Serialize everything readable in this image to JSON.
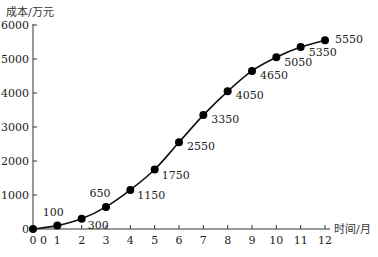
{
  "chart_data": {
    "type": "line",
    "title": "",
    "xlabel": "时间/月",
    "ylabel": "成本/万元",
    "x": [
      0,
      1,
      2,
      3,
      4,
      5,
      6,
      7,
      8,
      9,
      10,
      11,
      12
    ],
    "series": [
      {
        "name": "成本",
        "values": [
          0,
          100,
          300,
          650,
          1150,
          1750,
          2550,
          3350,
          4050,
          4650,
          5050,
          5350,
          5550
        ]
      }
    ],
    "data_labels": [
      "0",
      "100",
      "300",
      "650",
      "1150",
      "1750",
      "2550",
      "3350",
      "4050",
      "4650",
      "5050",
      "5350",
      "5550"
    ],
    "xticks": [
      "0",
      "1",
      "2",
      "3",
      "4",
      "5",
      "6",
      "7",
      "8",
      "9",
      "10",
      "11",
      "12"
    ],
    "yticks": [
      "0",
      "1000",
      "2000",
      "3000",
      "4000",
      "5000",
      "6000"
    ],
    "xlim": [
      0,
      12
    ],
    "ylim": [
      0,
      6000
    ],
    "grid": false,
    "legend": "none",
    "marker": "filled-circle",
    "line_color": "#111111"
  },
  "axes": {
    "y_title": "成本/万元",
    "x_title": "时间/月",
    "origin_extra_label": "0"
  }
}
